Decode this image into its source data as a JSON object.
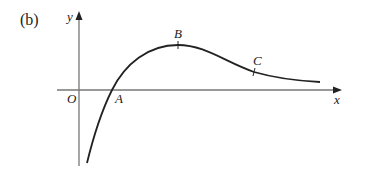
{
  "figure": {
    "part_label": "(b)",
    "axes": {
      "x_label": "x",
      "y_label": "y",
      "origin_label": "O"
    },
    "points": [
      {
        "name": "A",
        "description": "x-intercept of curve"
      },
      {
        "name": "B",
        "description": "maximum point of curve"
      },
      {
        "name": "C",
        "description": "point of inflection on curve"
      }
    ],
    "colors": {
      "curve": "#222222",
      "axis": "#777777",
      "text": "#222222"
    }
  }
}
